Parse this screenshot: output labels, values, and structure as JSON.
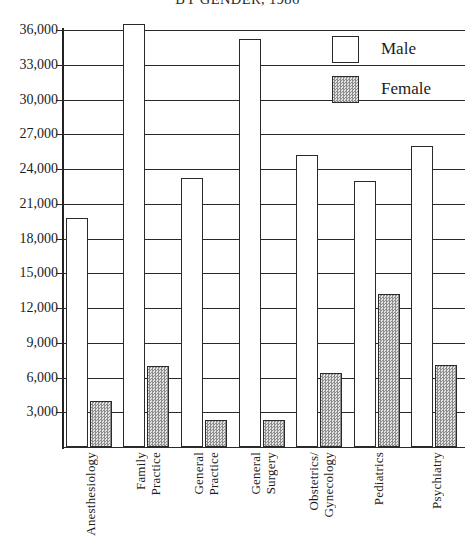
{
  "chart_data": {
    "type": "bar",
    "title": "BY GENDER, 1986",
    "xlabel": "",
    "ylabel": "",
    "ylim": [
      0,
      37500
    ],
    "ytick_values": [
      3000,
      6000,
      9000,
      12000,
      15000,
      18000,
      21000,
      24000,
      27000,
      30000,
      33000,
      36000
    ],
    "ytick_labels": [
      "3,000",
      "6,000",
      "9,000",
      "12,000",
      "15,000",
      "18,000",
      "21,000",
      "24,000",
      "27,000",
      "30,000",
      "33,000",
      "36,000"
    ],
    "grid": true,
    "legend_position": "top-right",
    "categories": [
      "Anesthesiology",
      "Family Practice",
      "General Practice",
      "General Surgery",
      "Obstetrics/Gynecology",
      "Pediatrics",
      "Psychiatry"
    ],
    "category_lines": [
      [
        "Anesthesiology"
      ],
      [
        "Family",
        "Practice"
      ],
      [
        "General",
        "Practice"
      ],
      [
        "General",
        "Surgery"
      ],
      [
        "Obstetrics/",
        "Gynecology"
      ],
      [
        "Pediatrics"
      ],
      [
        "Psychiatry"
      ]
    ],
    "series": [
      {
        "name": "Male",
        "color": "#ffffff",
        "values": [
          19800,
          36500,
          23200,
          35200,
          25200,
          23000,
          26000
        ]
      },
      {
        "name": "Female",
        "color": "#b9b9b9",
        "values": [
          4000,
          7000,
          2300,
          2300,
          6400,
          13200,
          7100
        ]
      }
    ]
  },
  "legend": {
    "items": [
      {
        "label": "Male",
        "swatch": "male"
      },
      {
        "label": "Female",
        "swatch": "female"
      }
    ]
  }
}
